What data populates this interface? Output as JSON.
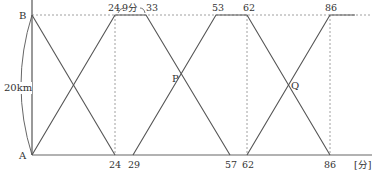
{
  "diagram": {
    "points": {
      "A": "A",
      "B": "B",
      "P": "P",
      "Q": "Q"
    },
    "distance_label": "20km",
    "unit_label": "[分]",
    "duration_label": "9分",
    "top_ticks": [
      "24",
      "33",
      "53",
      "62",
      "86"
    ],
    "bottom_ticks": [
      "24",
      "29",
      "57",
      "62",
      "86"
    ],
    "colors": {
      "line": "#555555",
      "dotted": "#888888",
      "text": "#333333"
    }
  }
}
